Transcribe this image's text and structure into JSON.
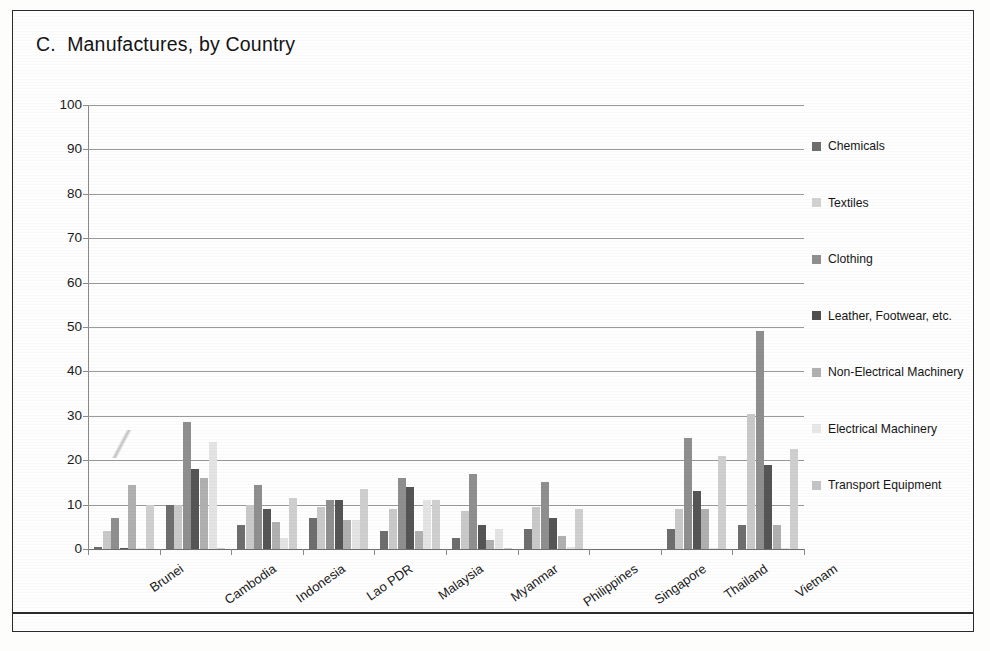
{
  "chart_data": {
    "type": "bar",
    "title": "C.  Manufactures, by Country",
    "xlabel": "",
    "ylabel": "",
    "ylim": [
      0,
      100
    ],
    "ytick_step": 10,
    "yticks": [
      "0",
      "10",
      "20",
      "30",
      "40",
      "50",
      "60",
      "70",
      "80",
      "90",
      "100"
    ],
    "grid": "horizontal",
    "legend_position": "right",
    "categories": [
      "Brunei",
      "Cambodia",
      "Indonesia",
      "Lao PDR",
      "Malaysia",
      "Myanmar",
      "Philippines",
      "Singapore",
      "Thailand",
      "Vietnam"
    ],
    "series": [
      {
        "name": "Chemicals",
        "color": "#6e6e6e",
        "values": [
          0.4,
          10.0,
          5.5,
          7.0,
          4.0,
          2.5,
          4.5,
          0,
          4.5,
          5.5
        ]
      },
      {
        "name": "Textiles",
        "color": "#c9c9c9",
        "values": [
          4.0,
          10.0,
          10.0,
          9.5,
          9.0,
          8.5,
          9.5,
          0,
          9.0,
          30.5
        ]
      },
      {
        "name": "Clothing",
        "color": "#8f8f8f",
        "values": [
          7.0,
          28.5,
          14.5,
          11.0,
          16.0,
          17.0,
          15.0,
          0,
          25.0,
          49.0
        ]
      },
      {
        "name": "Leather, Footwear, etc.",
        "color": "#555555",
        "values": [
          0.3,
          18.0,
          9.0,
          11.0,
          14.0,
          5.5,
          7.0,
          0,
          13.0,
          19.0
        ]
      },
      {
        "name": "Non-Electrical Machinery",
        "color": "#b0b0b0",
        "values": [
          14.5,
          16.0,
          6.0,
          6.5,
          4.0,
          2.0,
          3.0,
          0,
          9.0,
          5.5
        ]
      },
      {
        "name": "Electrical Machinery",
        "color": "#e4e4e4",
        "values": [
          0.2,
          24.0,
          2.5,
          6.5,
          11.0,
          4.5,
          0.4,
          0,
          0.3,
          0.3
        ]
      },
      {
        "name": "Transport Equipment",
        "color": "#cfcfcf",
        "values": [
          10.0,
          0.2,
          11.5,
          13.5,
          11.0,
          0.2,
          9.0,
          0,
          21.0,
          22.5
        ]
      }
    ]
  },
  "legend": {
    "items": [
      {
        "label": "Chemicals",
        "color": "#6e6e6e"
      },
      {
        "label": "Textiles",
        "color": "#d2d2d2"
      },
      {
        "label": "Clothing",
        "color": "#8f8f8f"
      },
      {
        "label": "Leather, Footwear, etc.",
        "color": "#4f4f4f"
      },
      {
        "label": "Non-Electrical Machinery",
        "color": "#b0b0b0"
      },
      {
        "label": "Electrical Machinery",
        "color": "#e8e8e8"
      },
      {
        "label": "Transport Equipment",
        "color": "#c4c4c4"
      }
    ]
  }
}
